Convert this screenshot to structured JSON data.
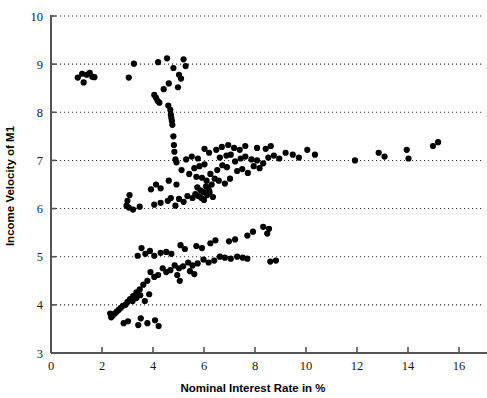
{
  "chart_data": {
    "type": "scatter",
    "title": "",
    "xlabel": "Nominal Interest Rate in %",
    "ylabel": "Income Velocity of M1",
    "xlim": [
      0,
      16.9
    ],
    "ylim": [
      3,
      10
    ],
    "xticks": [
      0,
      2,
      4,
      6,
      8,
      10,
      12,
      14,
      16
    ],
    "yticks": [
      3,
      4,
      5,
      6,
      7,
      8,
      9,
      10
    ],
    "xtick_labels": [
      "0",
      "2",
      "4",
      "6",
      "8",
      "10",
      "12",
      "14",
      "16"
    ],
    "ytick_labels": [
      "3",
      "4",
      "5",
      "6",
      "7",
      "8",
      "9",
      "10"
    ],
    "grid": "horizontal-dotted",
    "grid_values": [
      4,
      5,
      6,
      7,
      8,
      9,
      10
    ],
    "legend": null,
    "marker": "circle",
    "marker_color": "#000000",
    "marker_size": 4.0,
    "series": [
      {
        "name": "Income velocity of M1 vs nominal interest rate",
        "points": [
          [
            1.05,
            8.72
          ],
          [
            1.22,
            8.8
          ],
          [
            1.4,
            8.78
          ],
          [
            1.52,
            8.82
          ],
          [
            1.62,
            8.74
          ],
          [
            1.7,
            8.73
          ],
          [
            1.28,
            8.62
          ],
          [
            3.05,
            8.72
          ],
          [
            3.25,
            9.01
          ],
          [
            4.2,
            9.04
          ],
          [
            4.55,
            9.12
          ],
          [
            4.8,
            8.92
          ],
          [
            5.02,
            8.78
          ],
          [
            4.62,
            8.6
          ],
          [
            4.42,
            8.48
          ],
          [
            4.98,
            8.52
          ],
          [
            5.2,
            9.1
          ],
          [
            5.28,
            8.96
          ],
          [
            5.1,
            8.7
          ],
          [
            4.05,
            8.36
          ],
          [
            4.12,
            8.3
          ],
          [
            4.18,
            8.24
          ],
          [
            4.25,
            8.2
          ],
          [
            4.6,
            8.14
          ],
          [
            4.68,
            8.05
          ],
          [
            4.7,
            7.95
          ],
          [
            4.72,
            7.88
          ],
          [
            4.74,
            7.82
          ],
          [
            4.76,
            7.74
          ],
          [
            4.8,
            7.5
          ],
          [
            4.82,
            7.32
          ],
          [
            4.84,
            7.18
          ],
          [
            4.88,
            7.02
          ],
          [
            4.92,
            6.96
          ],
          [
            5.3,
            7.02
          ],
          [
            5.52,
            7.08
          ],
          [
            5.76,
            7.04
          ],
          [
            5.12,
            6.8
          ],
          [
            5.42,
            6.72
          ],
          [
            5.7,
            6.66
          ],
          [
            4.62,
            6.58
          ],
          [
            4.92,
            6.5
          ],
          [
            4.3,
            6.42
          ],
          [
            4.12,
            6.5
          ],
          [
            3.92,
            6.4
          ],
          [
            3.08,
            6.28
          ],
          [
            3.0,
            6.16
          ],
          [
            2.96,
            6.06
          ],
          [
            3.05,
            6.02
          ],
          [
            3.22,
            5.98
          ],
          [
            3.48,
            6.04
          ],
          [
            4.05,
            6.08
          ],
          [
            4.3,
            6.12
          ],
          [
            4.58,
            6.16
          ],
          [
            4.7,
            6.22
          ],
          [
            5.02,
            6.2
          ],
          [
            5.2,
            6.14
          ],
          [
            5.35,
            6.26
          ],
          [
            5.55,
            6.22
          ],
          [
            4.88,
            6.06
          ],
          [
            5.62,
            6.84
          ],
          [
            5.82,
            6.88
          ],
          [
            6.02,
            6.92
          ],
          [
            5.92,
            6.64
          ],
          [
            6.1,
            6.58
          ],
          [
            6.25,
            6.72
          ],
          [
            5.74,
            6.44
          ],
          [
            5.86,
            6.38
          ],
          [
            5.98,
            6.34
          ],
          [
            6.08,
            6.46
          ],
          [
            6.18,
            6.4
          ],
          [
            6.3,
            6.5
          ],
          [
            6.42,
            6.62
          ],
          [
            5.66,
            6.3
          ],
          [
            5.78,
            6.26
          ],
          [
            5.9,
            6.22
          ],
          [
            6.0,
            6.18
          ],
          [
            6.12,
            6.28
          ],
          [
            6.22,
            6.34
          ],
          [
            6.35,
            6.24
          ],
          [
            6.52,
            6.8
          ],
          [
            6.72,
            6.9
          ],
          [
            6.9,
            6.86
          ],
          [
            6.58,
            6.58
          ],
          [
            6.82,
            6.52
          ],
          [
            7.02,
            6.62
          ],
          [
            7.22,
            6.98
          ],
          [
            7.44,
            7.04
          ],
          [
            7.62,
            7.08
          ],
          [
            7.05,
            7.12
          ],
          [
            6.88,
            7.1
          ],
          [
            6.62,
            7.06
          ],
          [
            7.3,
            6.78
          ],
          [
            7.5,
            6.82
          ],
          [
            7.72,
            6.74
          ],
          [
            7.86,
            7.02
          ],
          [
            8.08,
            7.0
          ],
          [
            8.32,
            6.94
          ],
          [
            8.52,
            7.06
          ],
          [
            8.74,
            7.1
          ],
          [
            8.95,
            7.04
          ],
          [
            7.95,
            6.88
          ],
          [
            8.18,
            6.84
          ],
          [
            9.2,
            7.16
          ],
          [
            9.48,
            7.12
          ],
          [
            9.72,
            7.06
          ],
          [
            10.05,
            7.22
          ],
          [
            10.35,
            7.12
          ],
          [
            8.42,
            7.24
          ],
          [
            8.62,
            7.3
          ],
          [
            8.08,
            7.26
          ],
          [
            7.62,
            7.3
          ],
          [
            7.4,
            7.22
          ],
          [
            7.18,
            7.26
          ],
          [
            6.95,
            7.32
          ],
          [
            6.7,
            7.28
          ],
          [
            6.48,
            7.22
          ],
          [
            6.2,
            7.16
          ],
          [
            6.02,
            7.24
          ],
          [
            11.92,
            7.0
          ],
          [
            12.85,
            7.16
          ],
          [
            13.08,
            7.08
          ],
          [
            13.95,
            7.22
          ],
          [
            14.02,
            7.04
          ],
          [
            14.98,
            7.3
          ],
          [
            15.18,
            7.38
          ],
          [
            8.32,
            5.62
          ],
          [
            8.55,
            5.58
          ],
          [
            8.48,
            5.48
          ],
          [
            7.92,
            5.52
          ],
          [
            7.7,
            5.44
          ],
          [
            6.98,
            5.32
          ],
          [
            7.22,
            5.36
          ],
          [
            6.25,
            5.28
          ],
          [
            6.45,
            5.34
          ],
          [
            5.7,
            5.22
          ],
          [
            5.92,
            5.18
          ],
          [
            5.08,
            5.24
          ],
          [
            5.25,
            5.16
          ],
          [
            4.52,
            5.1
          ],
          [
            4.72,
            5.06
          ],
          [
            4.3,
            5.08
          ],
          [
            3.88,
            5.12
          ],
          [
            4.05,
            5.02
          ],
          [
            3.7,
            5.06
          ],
          [
            3.55,
            5.18
          ],
          [
            3.4,
            5.02
          ],
          [
            6.62,
            5.0
          ],
          [
            6.82,
            4.98
          ],
          [
            7.05,
            4.96
          ],
          [
            7.3,
            5.0
          ],
          [
            7.52,
            4.98
          ],
          [
            7.7,
            4.96
          ],
          [
            6.4,
            4.92
          ],
          [
            6.18,
            4.88
          ],
          [
            5.98,
            4.94
          ],
          [
            5.75,
            4.86
          ],
          [
            5.55,
            4.82
          ],
          [
            5.38,
            4.88
          ],
          [
            5.18,
            4.8
          ],
          [
            5.02,
            4.76
          ],
          [
            4.85,
            4.82
          ],
          [
            4.68,
            4.72
          ],
          [
            4.52,
            4.68
          ],
          [
            4.38,
            4.76
          ],
          [
            4.2,
            4.62
          ],
          [
            4.05,
            4.58
          ],
          [
            3.9,
            4.68
          ],
          [
            3.78,
            4.5
          ],
          [
            3.62,
            4.42
          ],
          [
            3.48,
            4.32
          ],
          [
            3.35,
            4.26
          ],
          [
            3.22,
            4.18
          ],
          [
            3.1,
            4.12
          ],
          [
            3.0,
            4.06
          ],
          [
            2.92,
            4.0
          ],
          [
            2.82,
            3.98
          ],
          [
            2.74,
            3.94
          ],
          [
            2.66,
            3.9
          ],
          [
            2.58,
            3.86
          ],
          [
            2.5,
            3.82
          ],
          [
            2.42,
            3.78
          ],
          [
            2.36,
            3.74
          ],
          [
            2.32,
            3.82
          ],
          [
            2.85,
            3.62
          ],
          [
            3.02,
            3.66
          ],
          [
            3.42,
            3.58
          ],
          [
            3.78,
            3.62
          ],
          [
            3.52,
            3.72
          ],
          [
            4.08,
            3.68
          ],
          [
            4.22,
            3.56
          ],
          [
            3.2,
            4.08
          ],
          [
            3.35,
            4.14
          ],
          [
            3.5,
            4.2
          ],
          [
            3.68,
            4.08
          ],
          [
            3.85,
            4.22
          ],
          [
            5.45,
            4.7
          ],
          [
            5.62,
            4.64
          ],
          [
            5.05,
            4.5
          ],
          [
            4.95,
            4.62
          ],
          [
            8.6,
            4.9
          ],
          [
            8.82,
            4.92
          ]
        ]
      }
    ]
  }
}
